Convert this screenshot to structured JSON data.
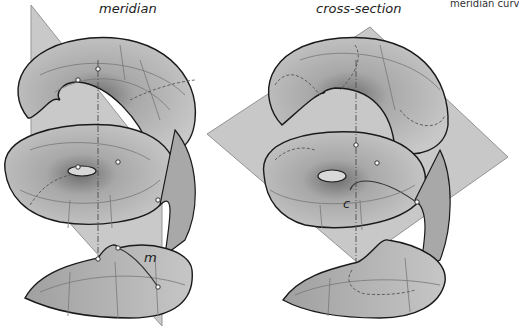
{
  "panels": {
    "left": {
      "title": "meridian",
      "curve_label": "m"
    },
    "right": {
      "title": "cross-section",
      "curve_label": "c"
    },
    "clipped_right": {
      "title": "meridian curv"
    }
  },
  "colors": {
    "surface": "#b4b4b4",
    "surface_dark": "#7a7a7a",
    "plane": "#bdbdbd",
    "outline": "#1a1a1a",
    "grid": "#6e6e6e"
  }
}
